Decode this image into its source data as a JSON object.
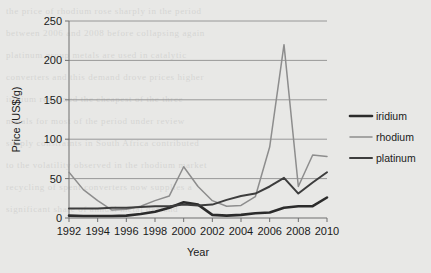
{
  "background": {
    "page_color": "#e8e8e6",
    "bleed_text": [
      "the price of rhodium rose sharply in the period",
      "between 2006 and 2008 before collapsing again",
      "platinum group metals are used in catalytic",
      "converters and this demand drove prices higher",
      "iridium remained the cheapest of the three",
      "metals for most of the period under review",
      "supply constraints in South Africa contributed",
      "to the volatility observed in the rhodium market",
      "recycling of spent converters now supplies a",
      "significant share of annual metal demand"
    ]
  },
  "chart_data": {
    "type": "line",
    "title": "",
    "xlabel": "Year",
    "ylabel": "Price (US$/g)",
    "xlim": [
      1992,
      2010
    ],
    "ylim": [
      0,
      250
    ],
    "yticks": [
      0,
      50,
      100,
      150,
      200,
      250
    ],
    "xticks": [
      1992,
      1994,
      1996,
      1998,
      2000,
      2002,
      2004,
      2006,
      2008,
      2010
    ],
    "xtick_labels": [
      "1992",
      "1994",
      "1996",
      "1998",
      "2000",
      "2002",
      "2004",
      "2006",
      "2008",
      "2010"
    ],
    "ytick_labels": [
      "0",
      "50",
      "100",
      "150",
      "200",
      "250"
    ],
    "grid": "horizontal",
    "legend_position": "right",
    "x": [
      1992,
      1993,
      1994,
      1995,
      1996,
      1997,
      1998,
      1999,
      2000,
      2001,
      2002,
      2003,
      2004,
      2005,
      2006,
      2007,
      2008,
      2009,
      2010
    ],
    "series": [
      {
        "name": "iridium",
        "color": "#2b2b2b",
        "width": 2.6,
        "values": [
          3,
          2.5,
          2.5,
          2.5,
          3,
          5,
          8,
          13,
          20,
          17,
          4,
          3,
          4,
          6,
          7,
          13,
          15,
          15,
          26
        ]
      },
      {
        "name": "rhodium",
        "color": "#8d8d8d",
        "width": 1.5,
        "values": [
          58,
          36,
          22,
          10,
          11,
          15,
          22,
          28,
          65,
          40,
          22,
          15,
          16,
          27,
          90,
          220,
          40,
          80,
          78
        ]
      },
      {
        "name": "platinum",
        "color": "#3d3d3d",
        "width": 2.0,
        "values": [
          12,
          12,
          12,
          13,
          13,
          14,
          15,
          15,
          17,
          16,
          17,
          23,
          28,
          31,
          40,
          51,
          31,
          45,
          58
        ]
      }
    ]
  },
  "legend": {
    "items": [
      {
        "label": "iridium"
      },
      {
        "label": "rhodium"
      },
      {
        "label": "platinum"
      }
    ]
  }
}
